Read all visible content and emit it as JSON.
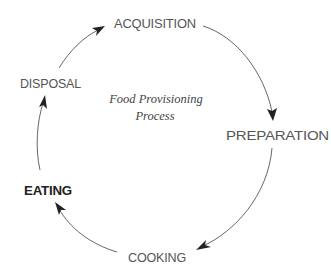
{
  "diagram": {
    "type": "cycle",
    "center": {
      "line1": "Food Provisioning",
      "line2": "Process"
    },
    "nodes": [
      {
        "id": "acquisition",
        "label": "ACQUISITION"
      },
      {
        "id": "preparation",
        "label": "PREPARATION"
      },
      {
        "id": "cooking",
        "label": "COOKING"
      },
      {
        "id": "eating",
        "label": "EATING"
      },
      {
        "id": "disposal",
        "label": "DISPOSAL"
      }
    ],
    "edges": [
      {
        "from": "acquisition",
        "to": "preparation"
      },
      {
        "from": "preparation",
        "to": "cooking"
      },
      {
        "from": "cooking",
        "to": "eating"
      },
      {
        "from": "eating",
        "to": "disposal"
      },
      {
        "from": "disposal",
        "to": "acquisition"
      }
    ],
    "colors": {
      "text": "#555555",
      "emphasis_text": "#222222",
      "arrow": "#555555",
      "background": "#ffffff"
    }
  }
}
